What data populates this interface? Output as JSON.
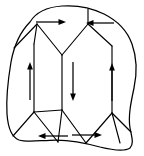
{
  "figure": {
    "type": "diagram",
    "background_color": "#ffffff",
    "line_color": "#000000",
    "arrow_color": "#000000",
    "width": 144,
    "height": 156
  },
  "grain": {
    "name": "grain-outline",
    "description": "Irregular closed polygon representing a single crystal grain",
    "path": "M 30 22 C 36 12 48 7 62 6 C 76 5 92 8 104 14 C 116 20 127 30 132 44 C 137 58 137 74 134 88 C 131 102 128 116 130 128 C 132 138 134 144 130 148 C 124 152 112 150 100 147 C 86 143 70 140 56 140 C 42 140 28 143 19 140 C 11 137 8 128 7 114 C 6 98 8 80 11 62 C 14 46 20 32 30 22 Z"
  },
  "domain_walls": [
    {
      "name": "wall-top-left-diagonal",
      "path": "M 14 48 L 37 24"
    },
    {
      "name": "wall-top-left-vertex-down",
      "path": "M 37 24 L 34 44"
    },
    {
      "name": "wall-closure-left-v-left",
      "path": "M 37 24 L 62 55"
    },
    {
      "name": "wall-closure-left-v-right",
      "path": "M 62 55 L 88 24"
    },
    {
      "name": "wall-top-center-vertex",
      "path": "M 88 24 L 88 9"
    },
    {
      "name": "wall-closure-right-v-right",
      "path": "M 88 24 L 112 46"
    },
    {
      "name": "wall-left-vertical",
      "path": "M 34 44 L 34 112"
    },
    {
      "name": "wall-center-left-vertical",
      "path": "M 62 55 L 62 110"
    },
    {
      "name": "wall-right-vertical",
      "path": "M 112 46 L 112 113"
    },
    {
      "name": "wall-bottom-left-diagonal",
      "path": "M 34 112 L 13 136"
    },
    {
      "name": "wall-bottom-closure-left-v-left",
      "path": "M 34 112 L 62 110"
    },
    {
      "name": "wall-bottom-left-v-down",
      "path": "M 34 112 L 58 142"
    },
    {
      "name": "wall-bottom-center-v-up",
      "path": "M 58 142 L 62 110"
    },
    {
      "name": "wall-bottom-right-v-down",
      "path": "M 62 110 L 86 143"
    },
    {
      "name": "wall-bottom-right-v-up",
      "path": "M 86 143 L 112 113"
    },
    {
      "name": "wall-bottom-right-corner",
      "path": "M 112 113 L 131 132"
    },
    {
      "name": "wall-bottom-right-stub",
      "path": "M 120 143 L 112 113"
    }
  ],
  "magnetization_arrows": [
    {
      "name": "arrow-top-left-right",
      "domain": "top-left closure domain",
      "direction": "right",
      "label": "→",
      "x1": 36,
      "y1": 22,
      "x2": 66,
      "y2": 22
    },
    {
      "name": "arrow-top-right-left",
      "domain": "top-right closure domain",
      "direction": "left",
      "label": "←",
      "x1": 114,
      "y1": 23,
      "x2": 86,
      "y2": 23
    },
    {
      "name": "arrow-left-up",
      "domain": "left vertical domain",
      "direction": "up",
      "label": "↑",
      "x1": 30,
      "y1": 100,
      "x2": 30,
      "y2": 62
    },
    {
      "name": "arrow-center-down",
      "domain": "central vertical domain",
      "direction": "down",
      "label": "↓",
      "x1": 73,
      "y1": 62,
      "x2": 73,
      "y2": 101
    },
    {
      "name": "arrow-right-up",
      "domain": "right vertical domain",
      "direction": "up",
      "label": "↑",
      "x1": 112,
      "y1": 101,
      "x2": 112,
      "y2": 63
    },
    {
      "name": "arrow-bottom-left-left",
      "domain": "bottom-left closure domain",
      "direction": "left",
      "label": "←",
      "x1": 68,
      "y1": 136,
      "x2": 38,
      "y2": 136
    },
    {
      "name": "arrow-bottom-right-right",
      "domain": "bottom-right closure domain",
      "direction": "right",
      "label": "→",
      "x1": 72,
      "y1": 135,
      "x2": 102,
      "y2": 135
    }
  ]
}
